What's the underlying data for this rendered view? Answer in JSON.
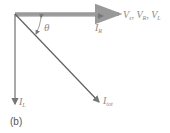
{
  "diagram": {
    "caption": "(b)",
    "angle_label": "θ",
    "vectors": [
      {
        "name": "voltage",
        "label_main": "V",
        "subs": [
          "s",
          "R",
          "L"
        ],
        "color": "#9a9a9a"
      },
      {
        "name": "ir",
        "label_main": "I",
        "sub": "R",
        "color": "#9a9a9a"
      },
      {
        "name": "il",
        "label_main": "I",
        "sub": "L",
        "color": "#707070"
      },
      {
        "name": "itot",
        "label_main": "I",
        "sub": "tot",
        "color": "#606060"
      }
    ],
    "colors": {
      "line": "#6a6a6a",
      "text": "#8a8a8a"
    }
  }
}
